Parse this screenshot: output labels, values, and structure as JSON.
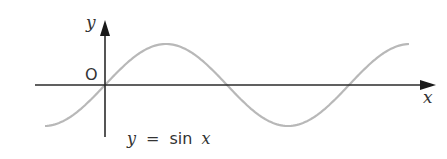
{
  "diagram": {
    "type": "function-graph",
    "function": "sin",
    "axis_labels": {
      "x": "x",
      "y": "y"
    },
    "origin_label": "O",
    "curve_label": {
      "lhs": "y",
      "eq": "=",
      "fn": "sin",
      "arg": "x"
    },
    "colors": {
      "axis": "#2b2b2b",
      "curve": "#b8b8b8",
      "text": "#333333"
    }
  },
  "chart_data": {
    "type": "line",
    "title": "y = sin x",
    "xlabel": "x",
    "ylabel": "y",
    "series": [
      {
        "name": "y = sin x",
        "x_range_periods": [
          -0.25,
          1.25
        ],
        "amplitude": 1
      }
    ],
    "grid": false,
    "ticks": "none"
  }
}
